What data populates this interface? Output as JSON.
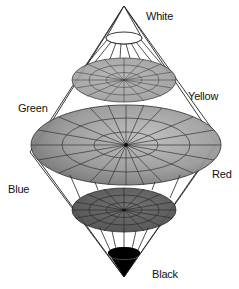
{
  "diagram": {
    "labels": {
      "white": "White",
      "green": "Green",
      "yellow": "Yellow",
      "blue": "Blue",
      "red": "Red",
      "black": "Black"
    },
    "colors": {
      "outline": "#111111",
      "upper_disk": "#a8a8a8",
      "middle_disk": "#8c8c8c",
      "lower_disk": "#5a5a5a",
      "black_cap": "#000000",
      "white_cap": "#ffffff"
    },
    "geometry": {
      "top_apex": [
        124,
        6
      ],
      "bottom_apex": [
        124,
        277
      ],
      "disks": [
        {
          "name": "white-cap",
          "cx": 124,
          "cy": 38,
          "rx": 18,
          "ry": 6
        },
        {
          "name": "upper-disk",
          "cx": 124,
          "cy": 80,
          "rx": 52,
          "ry": 22
        },
        {
          "name": "middle-disk",
          "cx": 126,
          "cy": 145,
          "rx": 95,
          "ry": 40
        },
        {
          "name": "lower-disk",
          "cx": 124,
          "cy": 210,
          "rx": 52,
          "ry": 22
        },
        {
          "name": "black-cap",
          "cx": 124,
          "cy": 253,
          "rx": 16,
          "ry": 6
        }
      ]
    }
  }
}
